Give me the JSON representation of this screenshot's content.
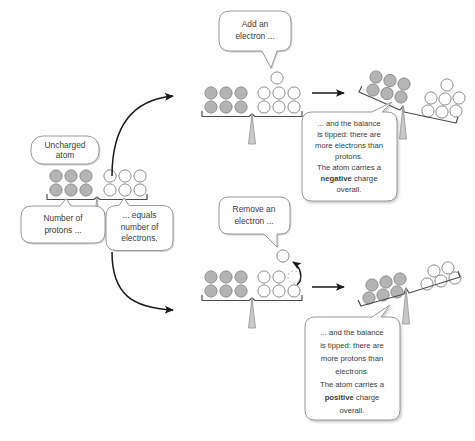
{
  "diagram": {
    "background_color": "#ffffff",
    "colors": {
      "proton_fill": "#b4b4b4",
      "proton_stroke": "#8c8c8c",
      "electron_fill": "#ffffff",
      "electron_stroke": "#8c8c8c",
      "beam_stroke": "#4d4d4d",
      "fulcrum_fill": "#c9c9c9",
      "fulcrum_stroke": "#9a9a9a",
      "callout_stroke": "#9a9a9a",
      "callout_fill": "#ffffff",
      "text_color": "#3b3b3b",
      "arrow_color": "#1a1a1a"
    }
  },
  "callouts": {
    "uncharged_atom": {
      "lines": [
        "Uncharged",
        "atom"
      ]
    },
    "number_of_protons": {
      "lines": [
        "Number of",
        "protons ..."
      ]
    },
    "equals_number_of_electrons": {
      "lines": [
        "... equals",
        "number of",
        "electrons."
      ]
    },
    "add_an_electron": {
      "lines": [
        "Add an",
        "electron ..."
      ]
    },
    "remove_an_electron": {
      "lines": [
        "Remove an",
        "electron ..."
      ]
    },
    "negative_result": {
      "lines": [
        "... and the balance",
        "is tipped: there are",
        "more electrons than",
        "protons.",
        "The atom carries a"
      ],
      "emphasis_line": {
        "before": "",
        "bold": "negative",
        "after": " charge"
      },
      "last_line": "overall."
    },
    "positive_result": {
      "lines": [
        "... and the balance",
        "is tipped: there are",
        "more protons than",
        "electrons.",
        "The atom carries a"
      ],
      "emphasis_line": {
        "before": "",
        "bold": "positive",
        "after": " charge"
      },
      "last_line": "overall."
    }
  },
  "balances": {
    "uncharged": {
      "name": "uncharged-atom-balance",
      "state": "level",
      "protons": 6,
      "electrons": 6,
      "removed_electrons": 0
    },
    "add_electron": {
      "name": "add-electron-balance",
      "state": "level",
      "protons": 6,
      "electrons": 6,
      "incoming_electron": 1
    },
    "negative_result": {
      "name": "negative-charge-balance",
      "state": "tipped-right",
      "protons": 6,
      "electrons": 7
    },
    "remove_electron": {
      "name": "remove-electron-balance",
      "state": "level",
      "protons": 6,
      "electrons": 5,
      "removed_electron_outline": 1,
      "outgoing_electron": 1
    },
    "positive_result": {
      "name": "positive-charge-balance",
      "state": "tipped-left",
      "protons": 6,
      "electrons": 5
    }
  },
  "arrows": {
    "branch_up": "curved-arrow-to-add-electron",
    "branch_down": "curved-arrow-to-remove-electron",
    "transition_top": "straight-arrow-to-negative-result",
    "transition_bottom": "straight-arrow-to-positive-result",
    "electron_leaving": "curved-arrow-electron-removed"
  }
}
